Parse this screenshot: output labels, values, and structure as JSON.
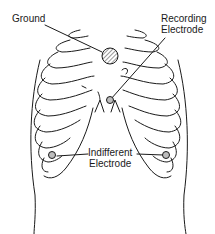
{
  "diagram": {
    "labels": {
      "ground": "Ground",
      "recording": [
        "Recording",
        "Electrode"
      ],
      "indifferent": [
        "Indifferent",
        "Electrode"
      ]
    },
    "colors": {
      "line": "#1a1a1a",
      "background": "#ffffff",
      "electrode_fill": "#bdbdbd"
    }
  }
}
